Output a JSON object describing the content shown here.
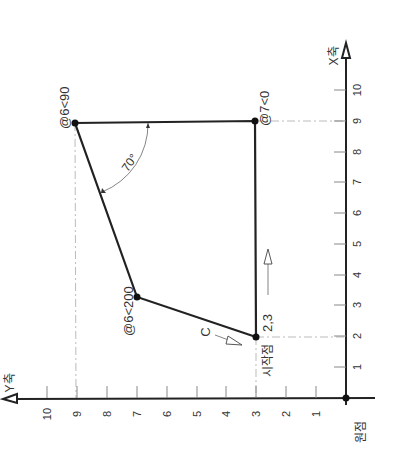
{
  "diagram": {
    "colors": {
      "line": "#222222",
      "tick": "#888888",
      "guide": "#aaaaaa",
      "text": "#333333"
    },
    "axes": {
      "x_axis_label": "X축",
      "y_axis_label": "Y축",
      "origin_label": "원점",
      "x_ticks": [
        "1",
        "2",
        "3",
        "4",
        "5",
        "6",
        "7",
        "8",
        "9",
        "10"
      ],
      "y_ticks": [
        "1",
        "2",
        "3",
        "4",
        "5",
        "6",
        "7",
        "8",
        "9",
        "10"
      ]
    },
    "points": [
      {
        "id": "start",
        "label": "2,3",
        "sub_label": "시작점",
        "x": 2,
        "y": 3
      },
      {
        "id": "p2",
        "label": "@6<200",
        "x": 3.3,
        "y": 7
      },
      {
        "id": "p3",
        "label": "@6<90",
        "x": 9,
        "y": 9
      },
      {
        "id": "p4",
        "label": "@7<0",
        "x": 9,
        "y": 3
      }
    ],
    "angle_label": "70°",
    "close_label": "C",
    "direction_arrow": "direction-arrow"
  }
}
